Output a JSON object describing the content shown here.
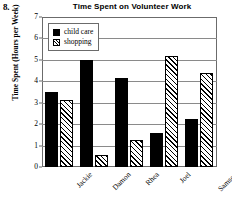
{
  "problem_number": "8.",
  "chart_data": {
    "type": "bar",
    "title": "Time Spent on Volunteer Work",
    "xlabel": "",
    "ylabel": "Time Spent (Hours per Week)",
    "categories": [
      "Jackie",
      "Damon",
      "Rhea",
      "Joel",
      "Samson"
    ],
    "series": [
      {
        "name": "child care",
        "values": [
          3.5,
          5.0,
          4.15,
          1.6,
          2.25
        ],
        "color": "#000000",
        "fill": "solid"
      },
      {
        "name": "shopping",
        "values": [
          3.15,
          0.55,
          1.25,
          5.2,
          4.4
        ],
        "color": "#000000",
        "fill": "hatched-diagonal"
      }
    ],
    "ylim": [
      0,
      7
    ],
    "yticks": [
      "0",
      "1",
      "2",
      "3",
      "4",
      "5",
      "6",
      "7"
    ],
    "grid": "horizontal",
    "legend_position": "top-left-inside",
    "legend_entries": [
      "child care",
      "shopping"
    ]
  }
}
